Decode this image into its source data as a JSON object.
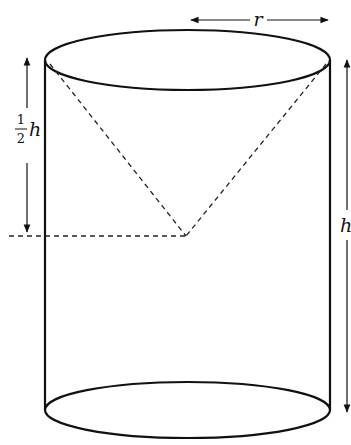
{
  "diagram": {
    "labels": {
      "radius": "r",
      "height": "h",
      "half_height_num": "1",
      "half_height_den": "2",
      "half_height_var": "h"
    },
    "shapes": {
      "cylinder": {
        "cx": 187.5,
        "top_y": 60,
        "bottom_y": 410,
        "rx": 142.5,
        "ry": 30
      },
      "cone": {
        "apex": [
          186,
          236
        ],
        "base_left": [
          45,
          60
        ],
        "base_right": [
          330,
          60
        ],
        "style": "dashed"
      },
      "cut_line": {
        "y": 236,
        "x_from": 10,
        "x_to": 186,
        "style": "dashed"
      }
    },
    "colors": {
      "stroke": "#111111",
      "background": "#ffffff"
    }
  }
}
